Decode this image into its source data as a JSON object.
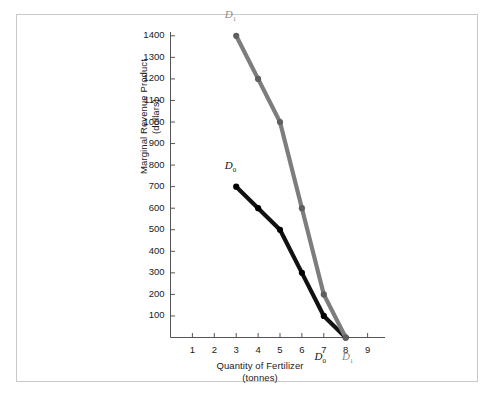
{
  "chart_data": {
    "type": "line",
    "title": "",
    "xlabel": "Quantity of Fertilizer\n(tonnes)",
    "xlabel_line1": "Quantity of Fertilizer",
    "xlabel_line2": "(tonnes)",
    "ylabel": "Marginal Revenue Product\n(dollars)",
    "ylabel_line1": "Marginal Revenue Product",
    "ylabel_line2": "(dollars)",
    "xlim": [
      0,
      9.6
    ],
    "ylim": [
      0,
      1450
    ],
    "xticks": [
      1,
      2,
      3,
      4,
      5,
      6,
      7,
      8,
      9
    ],
    "yticks": [
      100,
      200,
      300,
      400,
      500,
      600,
      700,
      800,
      900,
      1000,
      1100,
      1200,
      1300,
      1400
    ],
    "grid": false,
    "legend_position": "inline-curve-labels",
    "series": [
      {
        "name": "D0",
        "label": "D",
        "subscript": "0",
        "color": "#111111",
        "x": [
          3,
          4,
          5,
          6,
          7,
          8
        ],
        "values": [
          700,
          600,
          500,
          300,
          100,
          0
        ],
        "markers": true
      },
      {
        "name": "D1",
        "label": "D",
        "subscript": "1",
        "color": "#7d7d7d",
        "x": [
          3,
          4,
          5,
          6,
          7,
          8
        ],
        "values": [
          1400,
          1200,
          1000,
          600,
          200,
          0
        ],
        "markers": true
      }
    ],
    "annotations": [
      {
        "name": "d0-top-label",
        "text": "D",
        "subscript": "0",
        "x": 2.75,
        "y": 790,
        "color": "#111111"
      },
      {
        "name": "d1-top-label",
        "text": "D",
        "subscript": "1",
        "x": 2.75,
        "y": 1490,
        "color": "#8a8a8a"
      },
      {
        "name": "d0-bottom-label",
        "text": "D",
        "subscript": "0",
        "x": 6.85,
        "y": -95,
        "color": "#111111"
      },
      {
        "name": "d1-bottom-label",
        "text": "D",
        "subscript": "1",
        "x": 8.1,
        "y": -95,
        "color": "#8a8a8a"
      }
    ]
  },
  "figure": {
    "border_color": "#c9c9c9",
    "background": "#ffffff",
    "axis_color": "#555555"
  }
}
